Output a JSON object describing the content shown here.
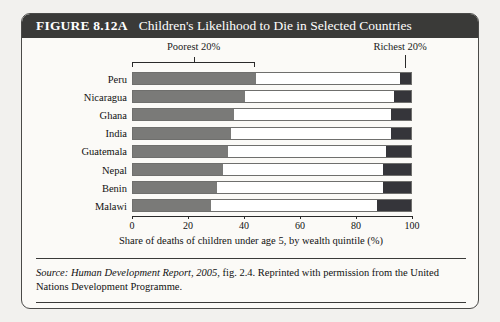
{
  "figure": {
    "number_label": "FIGURE 8.12A",
    "title": "Children's Likelihood to Die in Selected Countries"
  },
  "source_note": {
    "prefix": "Source:",
    "italic_part": "Human Development Report, 2005,",
    "rest": " fig. 2.4. Reprinted with permission from the United Nations Development Programme."
  },
  "colors": {
    "banner_background": "#3a3a38",
    "banner_text": "#ffffff",
    "poorest_quintile": "#7a7a78",
    "richest_quintile": "#35353a",
    "middle_quintiles": "#ffffff",
    "frame_border": "#4a4a48",
    "page_background": "#f2f1ee",
    "card_background": "#fbfaf7"
  },
  "chart_data": {
    "type": "bar",
    "orientation": "horizontal",
    "stacked": true,
    "title": "Children's Likelihood to Die in Selected Countries",
    "xlabel": "Share of deaths of children under age 5, by wealth quintile (%)",
    "ylabel": "",
    "xlim": [
      0,
      100
    ],
    "xticks": [
      0,
      20,
      40,
      60,
      80,
      100
    ],
    "xtick_labels": [
      "0",
      "20",
      "40",
      "60",
      "80",
      "100"
    ],
    "grid": false,
    "legend_position": "above-plot",
    "categories": [
      "Peru",
      "Nicaragua",
      "Ghana",
      "India",
      "Guatemala",
      "Nepal",
      "Benin",
      "Malawi"
    ],
    "series": [
      {
        "name": "Poorest 20%",
        "color": "#7a7a78",
        "values": [
          44,
          40,
          36,
          35,
          34,
          32,
          30,
          28
        ]
      },
      {
        "name": "Middle 60%",
        "color": "#ffffff",
        "values": [
          52,
          54,
          57,
          58,
          57,
          58,
          60,
          60
        ]
      },
      {
        "name": "Richest 20%",
        "color": "#35353a",
        "values": [
          4,
          6,
          7,
          7,
          9,
          10,
          10,
          12
        ]
      }
    ],
    "annotations": [
      {
        "text": "Poorest 20%",
        "target": "poorest-segment-bracket"
      },
      {
        "text": "Richest 20%",
        "target": "richest-segment-leader"
      }
    ]
  }
}
